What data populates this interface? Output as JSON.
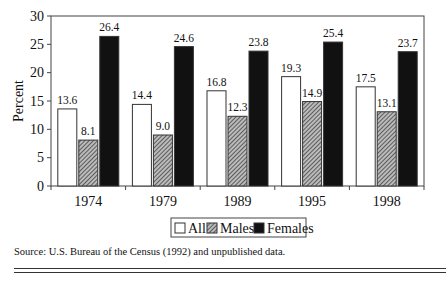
{
  "chart_data": {
    "type": "bar",
    "title": "",
    "xlabel": "",
    "ylabel": "Percent",
    "ylim": [
      0,
      30
    ],
    "yticks": [
      0,
      5,
      10,
      15,
      20,
      25,
      30
    ],
    "categories": [
      "1974",
      "1979",
      "1989",
      "1995",
      "1998"
    ],
    "series": [
      {
        "name": "All",
        "values": [
          13.6,
          14.4,
          16.8,
          19.3,
          17.5
        ],
        "labels": [
          "13.6",
          "14.4",
          "16.8",
          "19.3",
          "17.5"
        ],
        "fill": "#ffffff"
      },
      {
        "name": "Males",
        "values": [
          8.1,
          9.0,
          12.3,
          14.9,
          13.1
        ],
        "labels": [
          "8.1",
          "9.0",
          "12.3",
          "14.9",
          "13.1"
        ],
        "fill": "hatch"
      },
      {
        "name": "Females",
        "values": [
          26.4,
          24.6,
          23.8,
          25.4,
          23.7
        ],
        "labels": [
          "26.4",
          "24.6",
          "23.8",
          "25.4",
          "23.7"
        ],
        "fill": "#111111"
      }
    ],
    "legend": {
      "placement": "bottom-center",
      "entries": [
        "All",
        "Males",
        "Females"
      ]
    },
    "grid": false
  },
  "source": "Source: U.S. Bureau of the Census (1992) and unpublished data."
}
